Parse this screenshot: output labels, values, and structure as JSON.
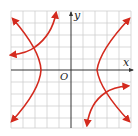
{
  "figure": {
    "type": "coordinate-graph",
    "axes": {
      "x_label": "x",
      "y_label": "y",
      "origin_label": "O"
    },
    "grid": {
      "cells_x": 10,
      "cells_y": 10,
      "color": "#c8c8c8"
    },
    "colors": {
      "curve": "#d42a1e",
      "axis": "#333333"
    },
    "curves": [
      {
        "name": "hyperbola",
        "description": "Horizontal hyperbola with vertices on the x-axis, opening left and right"
      },
      {
        "name": "second-curve",
        "description": "Curve in two pieces intersecting the hyperbola in quadrant II and quadrant IV"
      }
    ],
    "intersections": [
      {
        "quadrant": "II"
      },
      {
        "quadrant": "IV"
      }
    ]
  }
}
